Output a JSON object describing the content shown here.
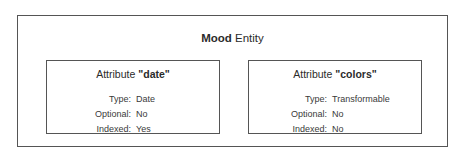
{
  "entity": {
    "name_bold": "Mood",
    "name_rest": " Entity"
  },
  "attributes": [
    {
      "prefix": "Attribute ",
      "name": "\"date\"",
      "rows": [
        {
          "label": "Type:",
          "value": "Date"
        },
        {
          "label": "Optional:",
          "value": "No"
        },
        {
          "label": "Indexed:",
          "value": "Yes"
        }
      ]
    },
    {
      "prefix": "Attribute ",
      "name": "\"colors\"",
      "rows": [
        {
          "label": "Type:",
          "value": "Transformable"
        },
        {
          "label": "Optional:",
          "value": "No"
        },
        {
          "label": "Indexed:",
          "value": "No"
        }
      ]
    }
  ],
  "colors": {
    "border": "#555555",
    "text": "#333333",
    "background": "#ffffff"
  }
}
